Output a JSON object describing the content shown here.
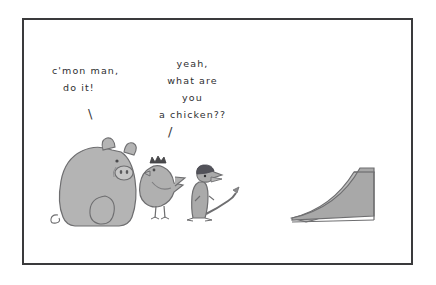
{
  "scene": {
    "title": "cartoon-panel",
    "background_color": "#ffffff",
    "frame_color": "#3a3a3c"
  },
  "captions": {
    "left": {
      "line1": "c'mon man,",
      "line2": "do it!",
      "pointer": "\\"
    },
    "right": {
      "line1": "yeah,",
      "line2": "what are",
      "line3": "you",
      "line4": "a chicken??",
      "pointer": "/"
    }
  },
  "figures": {
    "pig": {
      "label": "pig",
      "body_color": "#b4b4b4",
      "outline_color": "#6e6e70"
    },
    "chicken": {
      "label": "chicken",
      "body_color": "#b0b0b0",
      "comb_color": "#4a4a4c",
      "outline_color": "#6e6e70"
    },
    "meerkat": {
      "label": "meerkat",
      "body_color": "#aaaaaa",
      "head_color": "#53535a",
      "outline_color": "#6e6e70"
    },
    "ramp": {
      "label": "ramp",
      "top_color": "#b8b8b8",
      "side_color": "#a6a6a6",
      "outline_color": "#6e6e70"
    }
  }
}
